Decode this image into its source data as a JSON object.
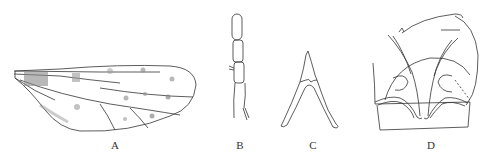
{
  "figure": {
    "panels": [
      {
        "id": "A",
        "label": "A",
        "subject": "wing"
      },
      {
        "id": "B",
        "label": "B",
        "subject": "antenna segments"
      },
      {
        "id": "C",
        "label": "C",
        "subject": "forked sclerite"
      },
      {
        "id": "D",
        "label": "D",
        "subject": "genitalia"
      }
    ],
    "line_color": "#333333",
    "background": "#ffffff"
  }
}
